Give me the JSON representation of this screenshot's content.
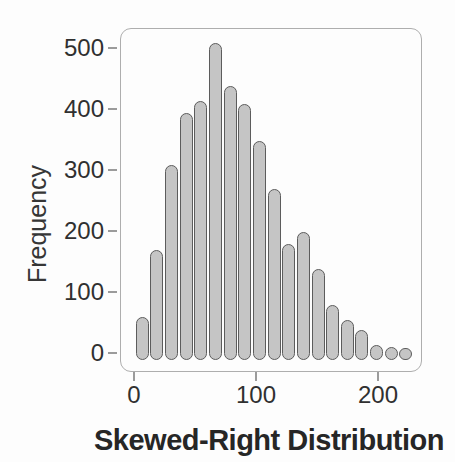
{
  "chart_data": {
    "type": "bar",
    "subtype": "histogram",
    "title": "Skewed-Right Distribution",
    "title_position": "bottom",
    "ylabel": "Frequency",
    "xlabel": "",
    "bin_width": 12,
    "bin_centers": [
      6,
      18,
      30,
      42,
      54,
      66,
      78,
      90,
      102,
      114,
      126,
      138,
      150,
      162,
      174,
      186,
      198,
      210,
      222
    ],
    "values": [
      60,
      170,
      310,
      395,
      415,
      510,
      440,
      410,
      350,
      270,
      180,
      200,
      140,
      80,
      55,
      40,
      15,
      12,
      10
    ],
    "x_ticks": [
      0,
      100,
      200
    ],
    "y_ticks": [
      0,
      100,
      200,
      300,
      400,
      500
    ],
    "xlim": [
      -11,
      236
    ],
    "ylim": [
      0,
      533
    ],
    "grid": false,
    "legend": null,
    "bar_style": "rounded-capsule"
  },
  "colors": {
    "background": "#fdfdfd",
    "bar_fill": "#c5c5c5",
    "bar_border": "#5c5c5c",
    "frame_border": "#aeaeae",
    "tick": "#9b9b9b",
    "text": "#303030",
    "title_text": "#262626"
  }
}
